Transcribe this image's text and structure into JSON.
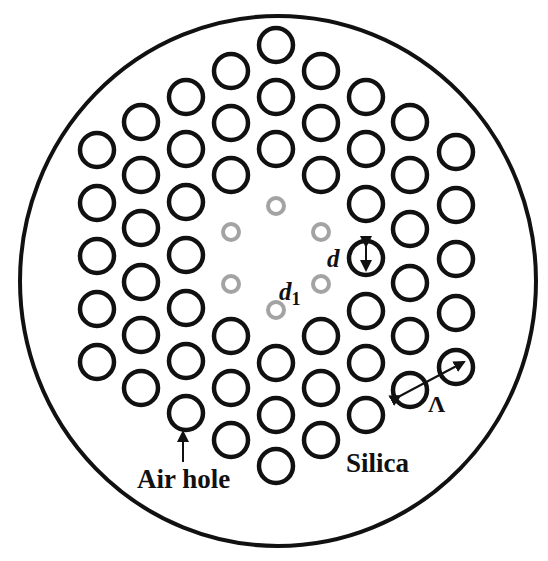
{
  "figure": {
    "type": "photonic-crystal-fiber-cross-section",
    "colors": {
      "background": "#ffffff",
      "outline": "#111111",
      "air_hole_stroke": "#111111",
      "inner_ring_stroke": "#a3a3a3"
    },
    "cladding": {
      "cx": 278,
      "cy": 281,
      "rx": 258,
      "ry": 265,
      "stroke_width": 4
    },
    "air_hole": {
      "r": 17,
      "stroke_width": 4.5
    },
    "inner_hole": {
      "r": 8,
      "stroke_width": 4
    },
    "air_holes": [
      [
        276,
        45
      ],
      [
        276,
        97
      ],
      [
        276,
        149
      ],
      [
        276,
        363
      ],
      [
        276,
        415
      ],
      [
        276,
        466
      ],
      [
        231,
        71
      ],
      [
        231,
        123
      ],
      [
        231,
        175
      ],
      [
        231,
        336
      ],
      [
        231,
        388
      ],
      [
        231,
        440
      ],
      [
        321,
        71
      ],
      [
        321,
        123
      ],
      [
        321,
        175
      ],
      [
        321,
        336
      ],
      [
        321,
        388
      ],
      [
        321,
        440
      ],
      [
        186,
        97
      ],
      [
        186,
        149
      ],
      [
        186,
        202
      ],
      [
        186,
        255
      ],
      [
        186,
        308
      ],
      [
        186,
        361
      ],
      [
        186,
        413
      ],
      [
        366,
        97
      ],
      [
        366,
        149
      ],
      [
        366,
        204
      ],
      [
        366,
        258
      ],
      [
        366,
        311
      ],
      [
        366,
        363
      ],
      [
        366,
        415
      ],
      [
        141,
        122
      ],
      [
        141,
        175
      ],
      [
        141,
        228
      ],
      [
        141,
        282
      ],
      [
        141,
        335
      ],
      [
        141,
        388
      ],
      [
        410,
        122
      ],
      [
        410,
        175
      ],
      [
        410,
        229
      ],
      [
        410,
        283
      ],
      [
        410,
        336
      ],
      [
        410,
        390
      ],
      [
        97,
        150
      ],
      [
        97,
        203
      ],
      [
        97,
        256
      ],
      [
        97,
        309
      ],
      [
        97,
        362
      ],
      [
        456,
        152
      ],
      [
        456,
        205
      ],
      [
        456,
        259
      ],
      [
        456,
        313
      ],
      [
        456,
        367
      ]
    ],
    "inner_holes": [
      [
        276,
        206
      ],
      [
        231,
        232
      ],
      [
        321,
        232
      ],
      [
        231,
        284
      ],
      [
        321,
        284
      ],
      [
        276,
        310
      ]
    ],
    "labels": {
      "d": "d",
      "d1_main": "d",
      "d1_sub": "1",
      "lambda": "Λ",
      "air_hole": "Air hole",
      "silica": "Silica"
    },
    "annotations": {
      "d_arrow": {
        "x": 366,
        "y1": 246,
        "y2": 270
      },
      "lambda_arrow": {
        "x1": 400,
        "y1": 396,
        "x2": 464,
        "y2": 362
      },
      "air_hole_arrow": {
        "x": 183,
        "y1": 432,
        "y2": 462
      }
    }
  }
}
